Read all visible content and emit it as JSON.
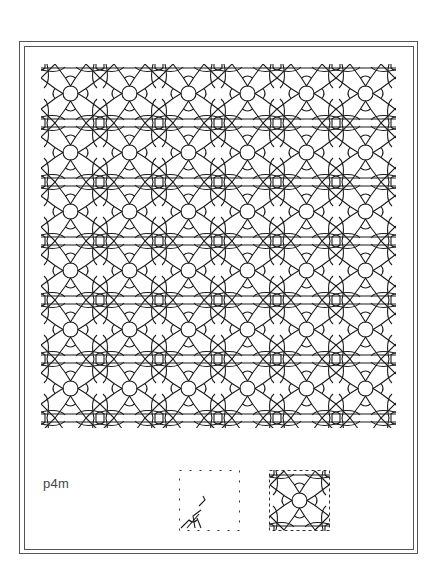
{
  "figure": {
    "group_label": "p4m",
    "pattern": {
      "description": "Repeating square tiling with central circles, teardrop triangles, diagonal strapwork and corner loops",
      "tile_size_px": 59,
      "columns": 6,
      "rows": 6,
      "stroke_color": "#1a1a1a"
    },
    "thumbnails": [
      {
        "name": "fundamental-region",
        "style": "dotted square with partial motif"
      },
      {
        "name": "unit-cell",
        "style": "dashed square with full tile motif"
      }
    ],
    "colors": {
      "background": "#ffffff",
      "frame": "#555555",
      "line": "#1a1a1a",
      "label": "#444444"
    }
  }
}
